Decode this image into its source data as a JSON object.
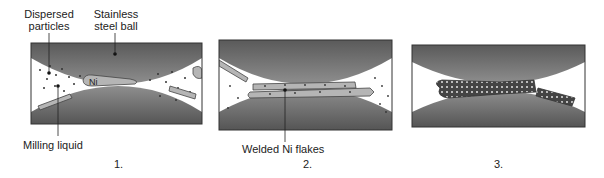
{
  "labels": {
    "dispersed_particles_1": "Dispersed",
    "dispersed_particles_2": "particles",
    "steel_ball_1": "Stainless",
    "steel_ball_2": "steel ball",
    "milling_liquid": "Milling liquid",
    "ni": "Ni",
    "welded_ni_flakes": "Welded Ni flakes"
  },
  "panels": [
    {
      "number": "1."
    },
    {
      "number": "2."
    },
    {
      "number": "3."
    }
  ],
  "colors": {
    "ball_dark": "#555555",
    "ball_light": "#9a9a9a",
    "flake": "#b0b0b0",
    "frame": "#333333",
    "liquid": "#ffffff"
  }
}
